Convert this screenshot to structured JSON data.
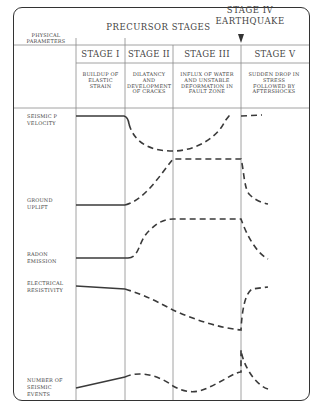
{
  "header": {
    "physical_parameters": "PHYSICAL PARAMETERS",
    "precursor_stages": "PRECURSOR STAGES",
    "stage_iv": "STAGE IV",
    "earthquake": "EARTHQUAKE"
  },
  "stages": [
    {
      "label": "STAGE I",
      "description": "BUILDUP OF ELASTIC STRAIN"
    },
    {
      "label": "STAGE II",
      "description": "DILATANCY AND DEVELOPMENT OF CRACKS"
    },
    {
      "label": "STAGE III",
      "description": "INFLUX OF WATER AND UNSTABLE DEFORMATION IN FAULT ZONE"
    },
    {
      "label": "STAGE V",
      "description": "SUDDEN DROP IN STRESS FOLLOWED BY AFTERSHOCKS"
    }
  ],
  "parameters": [
    {
      "label": "SEISMIC P VELOCITY",
      "trend": "flat, dips in stage II-III, recovers, then flat"
    },
    {
      "label": "GROUND UPLIFT",
      "trend": "flat, rises in stage II, plateau stage III, drops stage V"
    },
    {
      "label": "RADON EMISSION",
      "trend": "flat, rises in stage II, plateau stage III, drops stage V"
    },
    {
      "label": "ELECTRICAL RESISTIVITY",
      "trend": "flat, declines stages II-III, rises stage V"
    },
    {
      "label": "NUMBER OF SEISMIC EVENTS",
      "trend": "rises stage I, hump stage II, dip stage III, spike at earthquake, decays"
    }
  ],
  "colors": {
    "line": "#3a3a3a",
    "grid": "#888888",
    "background": "#ffffff"
  }
}
